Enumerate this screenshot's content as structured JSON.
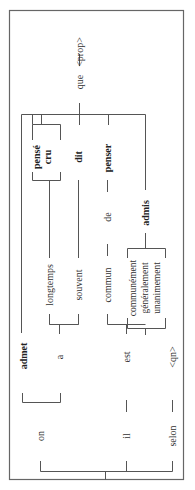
{
  "diagram": {
    "orientation": "rotated-90-ccw",
    "words": {
      "on": "on",
      "il": "il",
      "selon": "selon",
      "admet": "admet",
      "a": "a",
      "est": "est",
      "qn": "<qn>",
      "longtemps": "longtemps",
      "souvent": "souvent",
      "commun": "commun",
      "communement": "communément",
      "generalement": "généralement",
      "unanimement": "unanimement",
      "de": "de",
      "admis": "admis",
      "pense": "pensé",
      "cru": "cru",
      "dit": "dit",
      "penser": "penser",
      "que": "que",
      "dash": "—",
      "prop": "<prop>"
    }
  }
}
